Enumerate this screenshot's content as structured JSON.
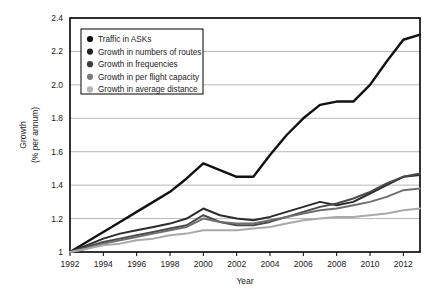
{
  "chart_data": {
    "type": "line",
    "title": "",
    "xlabel": "Year",
    "ylabel": "Growth\n(% per annum)",
    "ylabel_line1": "Growth",
    "ylabel_line2": "(% per annum)",
    "grid": true,
    "legend_position": "top-left",
    "xlim": [
      1992,
      2013
    ],
    "ylim": [
      1.0,
      2.4
    ],
    "x": [
      1992,
      1993,
      1994,
      1995,
      1996,
      1997,
      1998,
      1999,
      2000,
      2001,
      2002,
      2003,
      2004,
      2005,
      2006,
      2007,
      2008,
      2009,
      2010,
      2011,
      2012,
      2013
    ],
    "xticks": [
      1992,
      1994,
      1996,
      1998,
      2000,
      2002,
      2004,
      2006,
      2008,
      2010,
      2012
    ],
    "xtick_labels": [
      "1992",
      "1994",
      "1996",
      "1998",
      "2000",
      "2002",
      "2004",
      "2006",
      "2008",
      "2010",
      "2012"
    ],
    "yticks": [
      1.0,
      1.2,
      1.4,
      1.6,
      1.8,
      2.0,
      2.2,
      2.4
    ],
    "ytick_labels": [
      "1",
      "1.2",
      "1.4",
      "1.6",
      "1.8",
      "2.0",
      "2.2",
      "2.4"
    ],
    "series": [
      {
        "name": "Traffic in ASKs",
        "color": "#111111",
        "width": 2.4,
        "values": [
          1.0,
          1.06,
          1.12,
          1.18,
          1.24,
          1.3,
          1.36,
          1.44,
          1.53,
          1.49,
          1.45,
          1.45,
          1.58,
          1.7,
          1.8,
          1.88,
          1.9,
          1.9,
          2.0,
          2.14,
          2.27,
          2.3
        ]
      },
      {
        "name": "Growth in numbers of routes",
        "color": "#2b2b2b",
        "width": 2.0,
        "values": [
          1.0,
          1.04,
          1.08,
          1.11,
          1.13,
          1.15,
          1.17,
          1.2,
          1.26,
          1.22,
          1.2,
          1.19,
          1.21,
          1.24,
          1.27,
          1.3,
          1.28,
          1.3,
          1.35,
          1.4,
          1.45,
          1.46
        ]
      },
      {
        "name": "Growth in frequencies",
        "color": "#4a4a4a",
        "width": 2.0,
        "values": [
          1.0,
          1.03,
          1.06,
          1.08,
          1.1,
          1.12,
          1.14,
          1.16,
          1.22,
          1.18,
          1.16,
          1.16,
          1.18,
          1.21,
          1.24,
          1.27,
          1.29,
          1.32,
          1.36,
          1.41,
          1.45,
          1.47
        ]
      },
      {
        "name": "Growth in per flight capacity",
        "color": "#6f6f6f",
        "width": 2.0,
        "values": [
          1.0,
          1.02,
          1.05,
          1.07,
          1.09,
          1.11,
          1.13,
          1.15,
          1.2,
          1.18,
          1.17,
          1.17,
          1.19,
          1.21,
          1.23,
          1.25,
          1.26,
          1.28,
          1.3,
          1.33,
          1.37,
          1.38
        ]
      },
      {
        "name": "Growth in average distance",
        "color": "#a9a9a9",
        "width": 2.0,
        "values": [
          1.0,
          1.02,
          1.04,
          1.05,
          1.07,
          1.08,
          1.1,
          1.11,
          1.13,
          1.13,
          1.13,
          1.14,
          1.15,
          1.17,
          1.19,
          1.2,
          1.21,
          1.21,
          1.22,
          1.23,
          1.25,
          1.26
        ]
      }
    ]
  },
  "legend": {
    "items": [
      {
        "label": "Traffic in ASKs",
        "color": "#111111"
      },
      {
        "label": "Growth in numbers of routes",
        "color": "#1f1f1f"
      },
      {
        "label": "Growth in frequencies",
        "color": "#3d3d3d"
      },
      {
        "label": "Growth in per flight capacity",
        "color": "#7a7a7a"
      },
      {
        "label": "Growth in average distance",
        "color": "#b5b5b5"
      }
    ]
  },
  "axes": {
    "x_title": "Year",
    "y_title_line1": "Growth",
    "y_title_line2": "(% per annum)"
  },
  "colors": {
    "plot_border": "#000000",
    "gridline": "#b0b0b0",
    "background": "#ffffff",
    "legend_border": "#000000"
  }
}
